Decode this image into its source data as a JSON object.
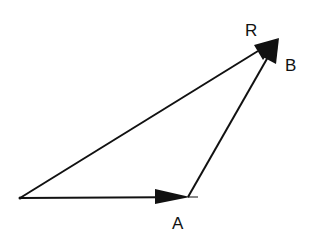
{
  "diagram": {
    "type": "vector-addition",
    "colors": {
      "line": "#111111",
      "background": "#ffffff"
    },
    "vectors": [
      {
        "name": "A",
        "from": [
          20,
          198
        ],
        "to": [
          188,
          197
        ]
      },
      {
        "name": "B",
        "from": [
          188,
          197
        ],
        "to": [
          279,
          38
        ]
      },
      {
        "name": "R",
        "from": [
          20,
          198
        ],
        "to": [
          279,
          38
        ]
      }
    ],
    "labels": {
      "R": "R",
      "B": "B",
      "A": "A"
    }
  }
}
